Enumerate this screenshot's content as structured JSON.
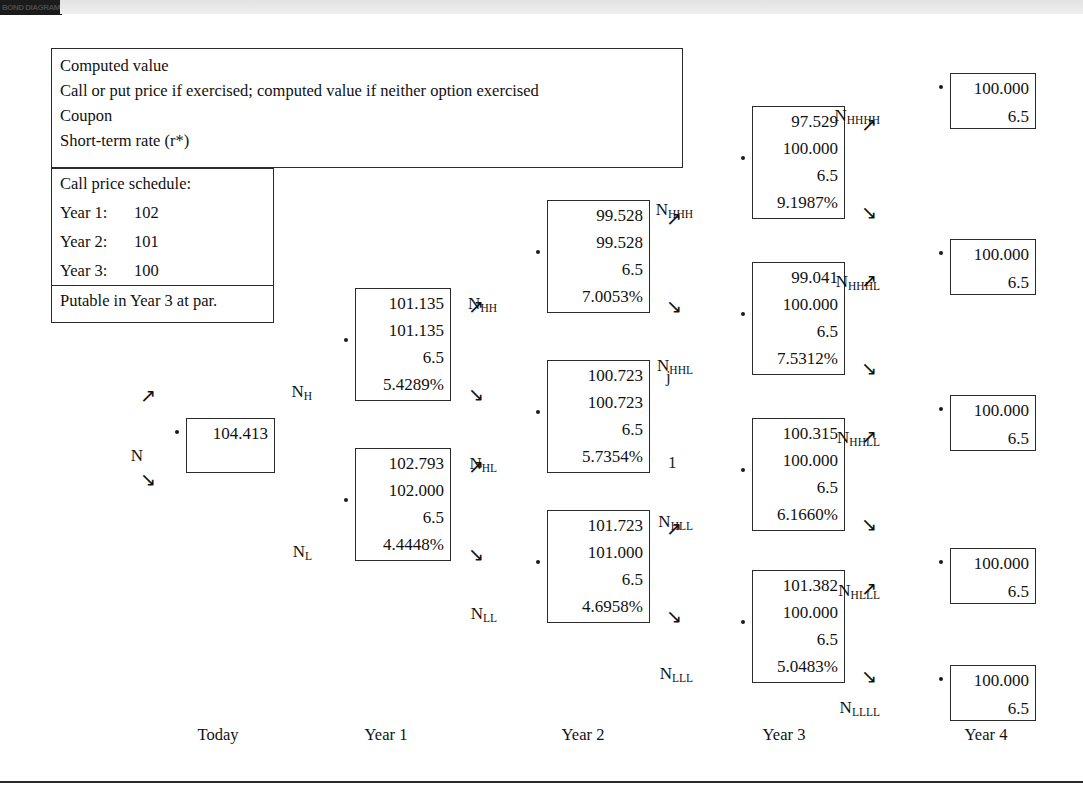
{
  "header": {
    "tab_label": "BOND DIAGRAM"
  },
  "legend": {
    "lines": [
      "Computed value",
      "Call or put price if exercised; computed value if neither option exercised",
      "Coupon",
      "Short-term rate (r*)"
    ]
  },
  "call_price_schedule": {
    "title": "Call price schedule:",
    "rows": [
      {
        "label": "Year 1:",
        "value": "102"
      },
      {
        "label": "Year 2:",
        "value": "101"
      },
      {
        "label": "Year 3:",
        "value": "100"
      }
    ],
    "footer": "Putable in Year 3 at par."
  },
  "timeline": [
    {
      "label": "Today",
      "x": 218
    },
    {
      "label": "Year 1",
      "x": 386
    },
    {
      "label": "Year 2",
      "x": 583
    },
    {
      "label": "Year 3",
      "x": 784
    },
    {
      "label": "Year 4",
      "x": 986
    }
  ],
  "chart_data": {
    "type": "tree",
    "coupon": 6.5,
    "root_value": 104.413,
    "root_rate": "3.5000%",
    "periods": [
      "Today",
      "Year 1",
      "Year 2",
      "Year 3",
      "Year 4"
    ],
    "row_order": [
      "computed value",
      "call or put price / computed value",
      "coupon",
      "short-term rate"
    ],
    "nodes": [
      {
        "id": "N",
        "label": "N",
        "computed": "104.413",
        "exercised": "",
        "coupon": "",
        "rate": "3.5000%",
        "rows": 2,
        "x": 186,
        "y": 418,
        "w": 89,
        "h": 55,
        "lx": 143,
        "ly": 446,
        "dx": 175,
        "dy": 430,
        "up": {
          "x": 140,
          "y": 386
        },
        "down": {
          "x": 140,
          "y": 470
        }
      },
      {
        "id": "NH",
        "label": "N",
        "sub": "H",
        "computed": "101.135",
        "exercised": "101.135",
        "coupon": "6.5",
        "rate": "5.4289%",
        "rows": 4,
        "x": 355,
        "y": 288,
        "w": 96,
        "h": 113,
        "lx": 312,
        "ly": 382,
        "dx": 344,
        "dy": 338,
        "up": {
          "x": 468,
          "y": 297
        },
        "down": {
          "x": 468,
          "y": 385
        }
      },
      {
        "id": "NL",
        "label": "N",
        "sub": "L",
        "computed": "102.793",
        "exercised": "102.000",
        "coupon": "6.5",
        "rate": "4.4448%",
        "rows": 4,
        "x": 355,
        "y": 448,
        "w": 96,
        "h": 113,
        "lx": 312,
        "ly": 542,
        "dx": 344,
        "dy": 498,
        "up": {
          "x": 468,
          "y": 457
        },
        "down": {
          "x": 468,
          "y": 545
        }
      },
      {
        "id": "NHH",
        "label": "N",
        "sub": "HH",
        "computed": "99.528",
        "exercised": "99.528",
        "coupon": "6.5",
        "rate": "7.0053%",
        "rows": 4,
        "x": 547,
        "y": 200,
        "w": 103,
        "h": 113,
        "lx": 497,
        "ly": 294,
        "dx": 536,
        "dy": 250,
        "up": {
          "x": 666,
          "y": 209
        },
        "down": {
          "x": 666,
          "y": 297
        }
      },
      {
        "id": "NHL",
        "label": "N",
        "sub": "HL",
        "computed": "100.723",
        "exercised": "100.723",
        "coupon": "6.5",
        "rate": "5.7354%",
        "rows": 4,
        "x": 547,
        "y": 360,
        "w": 103,
        "h": 113,
        "lx": 497,
        "ly": 454,
        "dx": 536,
        "dy": 410,
        "glyph_up": "j",
        "glyph_down": "1"
      },
      {
        "id": "NLL",
        "label": "N",
        "sub": "LL",
        "computed": "101.723",
        "exercised": "101.000",
        "coupon": "6.5",
        "rate": "4.6958%",
        "rows": 4,
        "x": 547,
        "y": 510,
        "w": 103,
        "h": 113,
        "lx": 497,
        "ly": 604,
        "dx": 536,
        "dy": 560,
        "up": {
          "x": 666,
          "y": 519
        },
        "down": {
          "x": 666,
          "y": 607
        }
      },
      {
        "id": "NHHH",
        "label": "N",
        "sub": "HHH",
        "computed": "97.529",
        "exercised": "100.000",
        "coupon": "6.5",
        "rate": "9.1987%",
        "rows": 4,
        "x": 752,
        "y": 106,
        "w": 93,
        "h": 113,
        "lx": 693,
        "ly": 200,
        "dx": 741,
        "dy": 156,
        "up": {
          "x": 861,
          "y": 115
        },
        "down": {
          "x": 861,
          "y": 203
        }
      },
      {
        "id": "NHHL",
        "label": "N",
        "sub": "HHL",
        "computed": "99.041",
        "exercised": "100.000",
        "coupon": "6.5",
        "rate": "7.5312%",
        "rows": 4,
        "x": 752,
        "y": 262,
        "w": 93,
        "h": 113,
        "lx": 693,
        "ly": 356,
        "dx": 741,
        "dy": 312,
        "up": {
          "x": 861,
          "y": 271
        },
        "down": {
          "x": 861,
          "y": 359
        }
      },
      {
        "id": "NHLL",
        "label": "N",
        "sub": "HLL",
        "computed": "100.315",
        "exercised": "100.000",
        "coupon": "6.5",
        "rate": "6.1660%",
        "rows": 4,
        "x": 752,
        "y": 418,
        "w": 93,
        "h": 113,
        "lx": 693,
        "ly": 512,
        "dx": 741,
        "dy": 468,
        "up": {
          "x": 861,
          "y": 427
        },
        "down": {
          "x": 861,
          "y": 515
        }
      },
      {
        "id": "NLLL",
        "label": "N",
        "sub": "LLL",
        "computed": "101.382",
        "exercised": "100.000",
        "coupon": "6.5",
        "rate": "5.0483%",
        "rows": 4,
        "x": 752,
        "y": 570,
        "w": 93,
        "h": 113,
        "lx": 693,
        "ly": 664,
        "dx": 741,
        "dy": 620,
        "up": {
          "x": 861,
          "y": 579
        },
        "down": {
          "x": 861,
          "y": 667
        }
      },
      {
        "id": "NHHHH",
        "label": "N",
        "sub": "HHHH",
        "computed": "100.000",
        "exercised": "",
        "coupon": "6.5",
        "rate": "",
        "rows": 2,
        "x": 950,
        "y": 73,
        "w": 86,
        "h": 56,
        "lx": 880,
        "ly": 106,
        "dx": 939,
        "dy": 85
      },
      {
        "id": "NHHHL",
        "label": "N",
        "sub": "HHHL",
        "computed": "100.000",
        "exercised": "",
        "coupon": "6.5",
        "rate": "",
        "rows": 2,
        "x": 950,
        "y": 239,
        "w": 86,
        "h": 56,
        "lx": 880,
        "ly": 272,
        "dx": 939,
        "dy": 251
      },
      {
        "id": "NHHLL",
        "label": "N",
        "sub": "HHLL",
        "computed": "100.000",
        "exercised": "",
        "coupon": "6.5",
        "rate": "",
        "rows": 2,
        "x": 950,
        "y": 395,
        "w": 86,
        "h": 56,
        "lx": 880,
        "ly": 428,
        "dx": 939,
        "dy": 407
      },
      {
        "id": "NHLLL",
        "label": "N",
        "sub": "HLLL",
        "computed": "100.000",
        "exercised": "",
        "coupon": "6.5",
        "rate": "",
        "rows": 2,
        "x": 950,
        "y": 548,
        "w": 86,
        "h": 56,
        "lx": 880,
        "ly": 581,
        "dx": 939,
        "dy": 560
      },
      {
        "id": "NLLLL",
        "label": "N",
        "sub": "LLLL",
        "computed": "100.000",
        "exercised": "",
        "coupon": "6.5",
        "rate": "",
        "rows": 2,
        "x": 950,
        "y": 665,
        "w": 86,
        "h": 56,
        "lx": 880,
        "ly": 698,
        "dx": 939,
        "dy": 677
      }
    ]
  },
  "layout": {
    "legend_box": {
      "x": 51,
      "y": 48,
      "w": 632,
      "h": 120
    },
    "schedule_box": {
      "x": 51,
      "y": 168,
      "w": 223,
      "h": 155
    }
  },
  "colors": {
    "ink": "#111111",
    "border": "#2b2b2b",
    "band": "#e6e6e6"
  }
}
